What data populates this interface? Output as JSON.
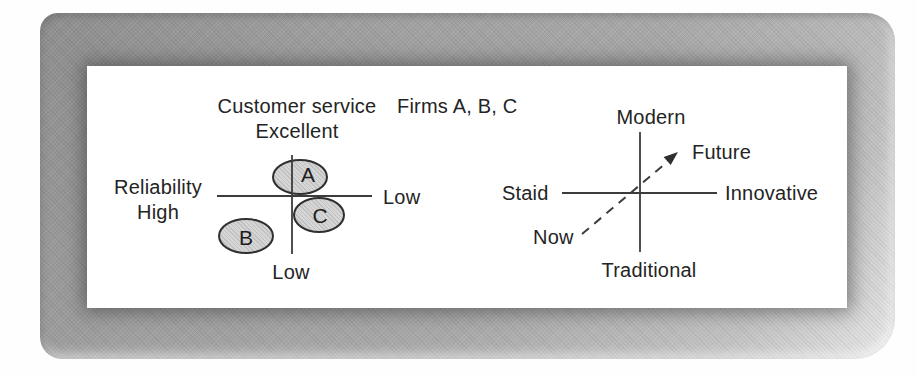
{
  "figure": {
    "left_map": {
      "axis_top_label_line1": "Customer service",
      "axis_top_label_line2": "Excellent",
      "caption": "Firms A, B, C",
      "axis_left_label_line1": "Reliability",
      "axis_left_label_line2": "High",
      "axis_right_label": "Low",
      "axis_bottom_label": "Low",
      "firms": [
        {
          "letter": "A",
          "x": 213,
          "y": 111,
          "rx": 28,
          "ry": 18
        },
        {
          "letter": "B",
          "x": 159,
          "y": 170,
          "rx": 28,
          "ry": 18
        },
        {
          "letter": "C",
          "x": 232,
          "y": 149,
          "rx": 26,
          "ry": 18
        }
      ]
    },
    "right_map": {
      "axis_top_label": "Modern",
      "axis_left_label": "Staid",
      "axis_right_label": "Innovative",
      "axis_bottom_label": "Traditional",
      "arrow_start_label": "Now",
      "arrow_end_label": "Future"
    },
    "colors": {
      "frame_gray": "#a6a6a6",
      "panel_white": "#ffffff",
      "ellipse_fill": "#d6d6d6",
      "ellipse_stroke": "#2f2f2f",
      "line_color": "#3c3c3c",
      "text_color": "#242424"
    }
  }
}
